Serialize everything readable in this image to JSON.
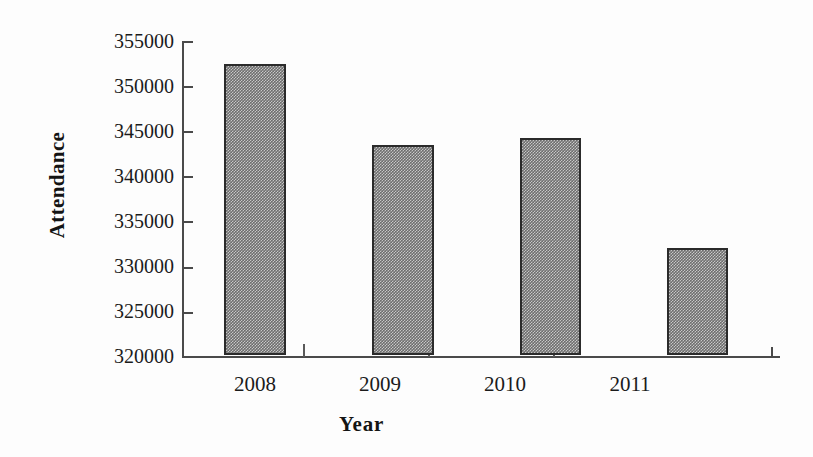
{
  "chart_data": {
    "type": "bar",
    "title": "",
    "subtitle": "",
    "xlabel": "Year",
    "ylabel": "Attendance",
    "categories": [
      "2008",
      "2009",
      "2010",
      "2011"
    ],
    "values": [
      352200,
      343300,
      344000,
      331800
    ],
    "series": [
      {
        "name": "Attendance",
        "values": [
          352200,
          343300,
          344000,
          331800
        ]
      }
    ],
    "ylim": [
      320000,
      355000
    ],
    "ytick_step": 5000,
    "yticks": [
      355000,
      350000,
      345000,
      340000,
      335000,
      330000,
      325000,
      320000
    ],
    "ytick_labels": [
      "355000",
      "350000",
      "345000",
      "340000",
      "335000",
      "330000",
      "325000",
      "320000"
    ],
    "xticks": [
      "2008",
      "2009",
      "2010",
      "2011"
    ],
    "grid": false,
    "legend": false,
    "legend_position": "none",
    "bar_fill_color": "#8c8c8c",
    "bar_edge_color": "#2b2b2b",
    "axis_color": "#4a4a4a",
    "background_color": "#fdfdfd",
    "annotations": []
  },
  "axis": {
    "y_title": "Attendance",
    "x_title": "Year"
  }
}
